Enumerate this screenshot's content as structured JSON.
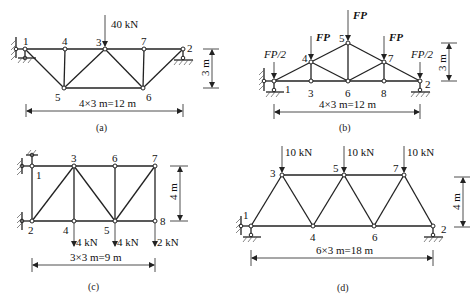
{
  "figure": {
    "panels": [
      {
        "id": "a",
        "caption": "(a)",
        "span_label": "4×3 m=12 m",
        "height_label": "3 m",
        "load_label": "40 kN",
        "node_labels": [
          "1",
          "4",
          "3",
          "7",
          "2",
          "5",
          "6"
        ]
      },
      {
        "id": "b",
        "caption": "(b)",
        "span_label": "4×3 m=12 m",
        "height_label": "3 m",
        "load_labels": [
          "FP/2",
          "FP",
          "FP",
          "FP",
          "FP/2"
        ],
        "node_labels": [
          "1",
          "3",
          "6",
          "8",
          "2",
          "4",
          "5",
          "7"
        ]
      },
      {
        "id": "c",
        "caption": "(c)",
        "span_label": "3×3 m=9 m",
        "height_label": "4 m",
        "load_labels": [
          "4 kN",
          "4 kN",
          "2 kN"
        ],
        "node_labels": [
          "1",
          "3",
          "6",
          "7",
          "2",
          "4",
          "5",
          "8"
        ]
      },
      {
        "id": "d",
        "caption": "(d)",
        "span_label": "6×3 m=18 m",
        "height_label": "4 m",
        "load_labels": [
          "10 kN",
          "10 kN",
          "10 kN"
        ],
        "node_labels": [
          "1",
          "3",
          "5",
          "7",
          "4",
          "6",
          "2"
        ]
      }
    ]
  }
}
